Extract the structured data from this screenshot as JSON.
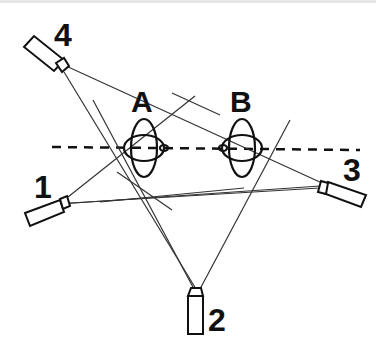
{
  "diagram": {
    "cameras": [
      {
        "id": "cam-1",
        "label": "1"
      },
      {
        "id": "cam-2",
        "label": "2"
      },
      {
        "id": "cam-3",
        "label": "3"
      },
      {
        "id": "cam-4",
        "label": "4"
      }
    ],
    "objects": [
      {
        "id": "obj-a",
        "label": "A"
      },
      {
        "id": "obj-b",
        "label": "B"
      }
    ],
    "colors": {
      "stroke": "#222222",
      "background": "#ffffff"
    }
  }
}
